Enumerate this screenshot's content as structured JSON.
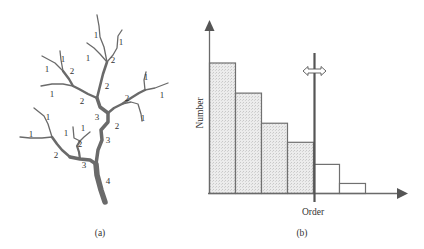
{
  "panel_a": {
    "caption": "(a)",
    "title": "Stream ordering of a branching tree",
    "order_labels": [
      {
        "text": "1",
        "x": 96,
        "y": 38
      },
      {
        "text": "1",
        "x": 121,
        "y": 45
      },
      {
        "text": "1",
        "x": 88,
        "y": 61
      },
      {
        "text": "2",
        "x": 113,
        "y": 63
      },
      {
        "text": "1",
        "x": 63,
        "y": 62
      },
      {
        "text": "1",
        "x": 47,
        "y": 72
      },
      {
        "text": "2",
        "x": 72,
        "y": 74
      },
      {
        "text": "2",
        "x": 107,
        "y": 89
      },
      {
        "text": "1",
        "x": 52,
        "y": 97
      },
      {
        "text": "2",
        "x": 82,
        "y": 104
      },
      {
        "text": "2",
        "x": 127,
        "y": 101
      },
      {
        "text": "1",
        "x": 146,
        "y": 80
      },
      {
        "text": "1",
        "x": 162,
        "y": 98
      },
      {
        "text": "3",
        "x": 97,
        "y": 120
      },
      {
        "text": "1",
        "x": 143,
        "y": 121
      },
      {
        "text": "2",
        "x": 117,
        "y": 129
      },
      {
        "text": "1",
        "x": 48,
        "y": 120
      },
      {
        "text": "1",
        "x": 83,
        "y": 131
      },
      {
        "text": "1",
        "x": 66,
        "y": 136
      },
      {
        "text": "1",
        "x": 31,
        "y": 137
      },
      {
        "text": "3",
        "x": 108,
        "y": 143
      },
      {
        "text": "2",
        "x": 80,
        "y": 147
      },
      {
        "text": "2",
        "x": 56,
        "y": 158
      },
      {
        "text": "3",
        "x": 84,
        "y": 168
      },
      {
        "text": "4",
        "x": 108,
        "y": 184
      }
    ]
  },
  "panel_b": {
    "caption": "(b)",
    "x_axis_label": "Order",
    "y_axis_label": "Number",
    "cutoff_marker": "double-headed-arrow"
  },
  "chart_data": {
    "type": "bar",
    "title": "",
    "xlabel": "Order",
    "ylabel": "Number",
    "categories": [
      "1",
      "2",
      "3",
      "4",
      "5",
      "6"
    ],
    "values": [
      130,
      100,
      70,
      51,
      29,
      10
    ],
    "shaded": [
      true,
      true,
      true,
      true,
      false,
      false
    ],
    "cutoff_after_category": "4",
    "ylim": [
      0,
      175
    ],
    "grid": false,
    "legend": "none",
    "colors": {
      "shaded_fill": "#e4e4e4",
      "unshaded_fill": "#ffffff",
      "stroke": "#707070",
      "axis": "#6a6a6a",
      "cutoff": "#555555"
    }
  }
}
